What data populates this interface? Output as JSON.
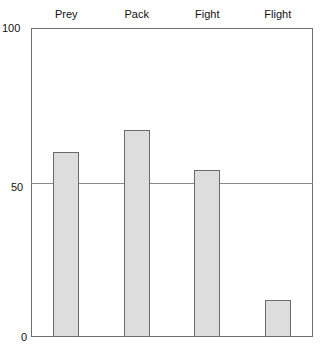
{
  "chart_data": {
    "type": "bar",
    "title": "",
    "subtitle": "",
    "xlabel": "",
    "ylabel": "",
    "categories": [
      "Prey",
      "Pack",
      "Fight",
      "Flight"
    ],
    "values": [
      60,
      67,
      54,
      12
    ],
    "ylim": [
      0,
      100
    ],
    "yticks": [
      0,
      50,
      100
    ],
    "ytick_labels": [
      "0",
      "50",
      "100"
    ],
    "grid": true,
    "gridlines_at": [
      50
    ],
    "legend": null,
    "legend_position": "none",
    "category_label_position": "top",
    "bar_fill_color": "#dddddd",
    "bar_border_color": "#6b6b6b",
    "axis_color": "#6e6e6e",
    "gridline_color": "#8a8a8a",
    "background_color": "#ffffff"
  },
  "axis": {
    "y_top_label": "100",
    "y_mid_label": "50",
    "y_bottom_label": "0"
  },
  "columns": {
    "label_0": "Prey",
    "label_1": "Pack",
    "label_2": "Fight",
    "label_3": "Flight"
  }
}
